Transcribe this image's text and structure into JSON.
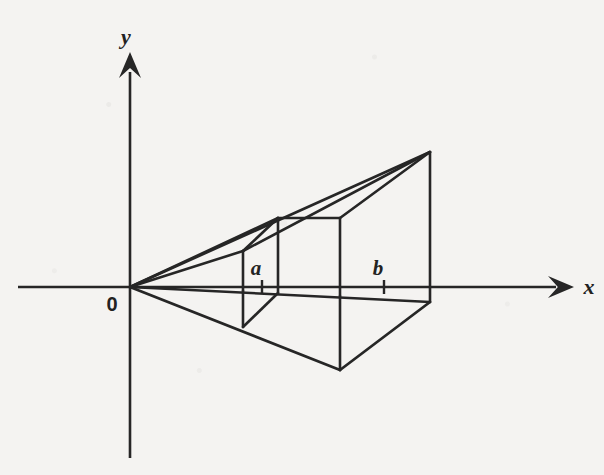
{
  "figure": {
    "background_color": "#f4f3f1",
    "ink_color": "#262626",
    "width": 604,
    "height": 475
  },
  "axes": {
    "origin": {
      "x": 130,
      "y": 287,
      "label": "0",
      "label_x": 112,
      "label_y": 311
    },
    "x_axis": {
      "label": "x",
      "label_x": 589,
      "label_y": 294,
      "start_x": 18,
      "end_x": 556,
      "y": 287,
      "arrow_tip_x": 574,
      "arrow_half_height": 11,
      "arrow_length": 26
    },
    "y_axis": {
      "label": "y",
      "label_x": 126,
      "label_y": 44,
      "top_y": 72,
      "bottom_y": 458,
      "x": 130,
      "arrow_tip_y": 52,
      "arrow_half_width": 11,
      "arrow_length": 26
    }
  },
  "ticks": [
    {
      "name": "a",
      "x": 262,
      "y": 287,
      "label": "a",
      "label_x": 256,
      "label_y": 275,
      "half_len": 7
    },
    {
      "name": "b",
      "x": 384,
      "y": 287,
      "label": "b",
      "label_x": 378,
      "label_y": 275,
      "half_len": 7
    }
  ],
  "vertices": {
    "O": {
      "x": 130,
      "y": 287
    },
    "apex_top_right": {
      "x": 430,
      "y": 152
    },
    "right_top_on_axis": {
      "x": 430,
      "y": 287
    },
    "right_bottom_front": {
      "x": 430,
      "y": 302
    },
    "a_back_top": {
      "x": 243,
      "y": 251
    },
    "a_back_axis": {
      "x": 243,
      "y": 291
    },
    "a_back_bottom": {
      "x": 243,
      "y": 327
    },
    "a_front_top": {
      "x": 278,
      "y": 218
    },
    "a_front_axis": {
      "x": 278,
      "y": 293
    },
    "b_front_top": {
      "x": 340,
      "y": 218
    },
    "b_front_axis": {
      "x": 340,
      "y": 296
    },
    "b_front_bottom": {
      "x": 340,
      "y": 370
    }
  },
  "segments": [
    {
      "name": "ray-origin-to-front-top",
      "x1": 130,
      "y1": 287,
      "x2": 278,
      "y2": 218,
      "width": 2.6
    },
    {
      "name": "ray-origin-to-back-top",
      "x1": 130,
      "y1": 287,
      "x2": 243,
      "y2": 251,
      "width": 2.6
    },
    {
      "name": "ray-origin-to-apex",
      "x1": 130,
      "y1": 287,
      "x2": 430,
      "y2": 152,
      "width": 2.6
    },
    {
      "name": "upper-back-edge-to-apex",
      "x1": 243,
      "y1": 251,
      "x2": 430,
      "y2": 152,
      "width": 2.6
    },
    {
      "name": "upper-front-edge-to-apex",
      "x1": 278,
      "y1": 218,
      "x2": 340,
      "y2": 218,
      "width": 2.6
    },
    {
      "name": "front-top-ridge-to-apex",
      "x1": 340,
      "y1": 218,
      "x2": 430,
      "y2": 152,
      "width": 2.6
    },
    {
      "name": "slanted-connector-a",
      "x1": 243,
      "y1": 251,
      "x2": 278,
      "y2": 218,
      "width": 2.6
    },
    {
      "name": "vertical-a-back-upper",
      "x1": 243,
      "y1": 251,
      "x2": 243,
      "y2": 291,
      "width": 2.6
    },
    {
      "name": "vertical-a-back-lower",
      "x1": 243,
      "y1": 291,
      "x2": 243,
      "y2": 327,
      "width": 2.6
    },
    {
      "name": "vertical-a-front",
      "x1": 278,
      "y1": 218,
      "x2": 278,
      "y2": 293,
      "width": 2.6
    },
    {
      "name": "vertical-b-front-upper",
      "x1": 340,
      "y1": 218,
      "x2": 340,
      "y2": 296,
      "width": 2.6
    },
    {
      "name": "vertical-b-front-lower",
      "x1": 340,
      "y1": 296,
      "x2": 340,
      "y2": 370,
      "width": 2.6
    },
    {
      "name": "vertical-right-apex-to-axis",
      "x1": 430,
      "y1": 152,
      "x2": 430,
      "y2": 287,
      "width": 2.6
    },
    {
      "name": "vertical-right-axis-to-front",
      "x1": 430,
      "y1": 287,
      "x2": 430,
      "y2": 302,
      "width": 2.6
    },
    {
      "name": "near-horizontal-origin-to-right",
      "x1": 130,
      "y1": 287,
      "x2": 430,
      "y2": 302,
      "width": 2.6
    },
    {
      "name": "lower-ray-origin-to-bottom",
      "x1": 130,
      "y1": 287,
      "x2": 340,
      "y2": 370,
      "width": 2.8
    },
    {
      "name": "lower-bottom-to-right",
      "x1": 340,
      "y1": 370,
      "x2": 430,
      "y2": 302,
      "width": 2.8
    },
    {
      "name": "lower-slant-a",
      "x1": 243,
      "y1": 327,
      "x2": 278,
      "y2": 293,
      "width": 2.6
    }
  ]
}
